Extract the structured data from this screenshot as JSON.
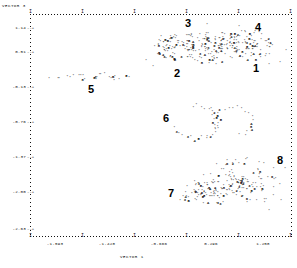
{
  "chart_data": {
    "type": "scatter",
    "title": "",
    "xlabel": "VECTOR 1",
    "ylabel": "VECTOR 3",
    "grid": false,
    "legend": "none",
    "xlim": [
      -1.72,
      1.42
    ],
    "ylim": [
      -2.63,
      1.14
    ],
    "xticks": [
      "-1.593",
      "-1.428",
      "-0.666",
      "0.296",
      "1.258"
    ],
    "yticks": [
      "1.14",
      "0.51",
      "-0.13",
      "-0.76",
      "-1.37",
      "-2.00",
      "-2.63"
    ],
    "point_glyph": "*",
    "overlap_glyphs": [
      "2",
      "3",
      "4",
      "5",
      "6",
      "8",
      "A",
      "B"
    ],
    "cluster_labels": [
      "1",
      "2",
      "3",
      "4",
      "5",
      "6",
      "7",
      "8"
    ],
    "clusters": [
      {
        "label": "1",
        "x": 0.92,
        "y": 0.3,
        "note": "right end of upper band"
      },
      {
        "label": "2",
        "x": -0.28,
        "y": 0.33,
        "note": "left-centre of upper band"
      },
      {
        "label": "3",
        "x": -0.07,
        "y": 0.86,
        "note": "top of upper band"
      },
      {
        "label": "4",
        "x": 0.84,
        "y": 0.88,
        "note": "upper right"
      },
      {
        "label": "5",
        "x": -1.1,
        "y": -0.24,
        "note": "isolated left band"
      },
      {
        "label": "6",
        "x": -0.26,
        "y": -0.76,
        "note": "middle ring cluster"
      },
      {
        "label": "7",
        "x": -0.36,
        "y": -1.9,
        "note": "lower left of bottom cloud"
      },
      {
        "label": "8",
        "x": 1.02,
        "y": -1.4,
        "note": "lower right of bottom cloud"
      }
    ],
    "series": [
      {
        "name": "upper band",
        "approx_count": 150
      },
      {
        "name": "left band",
        "approx_count": 22
      },
      {
        "name": "middle ring",
        "approx_count": 45
      },
      {
        "name": "lower cloud",
        "approx_count": 160
      }
    ]
  },
  "axes": {
    "y_title": "VECTOR  3",
    "x_title": "VECTOR  1",
    "y_tick_labels": [
      "1.14",
      "0.51",
      "-0.13",
      "-0.76",
      "-1.37",
      "-2.00",
      "-2.63"
    ],
    "x_tick_labels": [
      "-1.593",
      "-1.428",
      "-0.666",
      "0.296",
      "1.258"
    ],
    "tick_suffix": "--+",
    "corner_glyph": "+"
  },
  "cluster_markers": [
    {
      "id": "cluster-label-3",
      "text": "3"
    },
    {
      "id": "cluster-label-4",
      "text": "4"
    },
    {
      "id": "cluster-label-2",
      "text": "2"
    },
    {
      "id": "cluster-label-1",
      "text": "1"
    },
    {
      "id": "cluster-label-5",
      "text": "5"
    },
    {
      "id": "cluster-label-6",
      "text": "6"
    },
    {
      "id": "cluster-label-7",
      "text": "7"
    },
    {
      "id": "cluster-label-8",
      "text": "8"
    }
  ]
}
